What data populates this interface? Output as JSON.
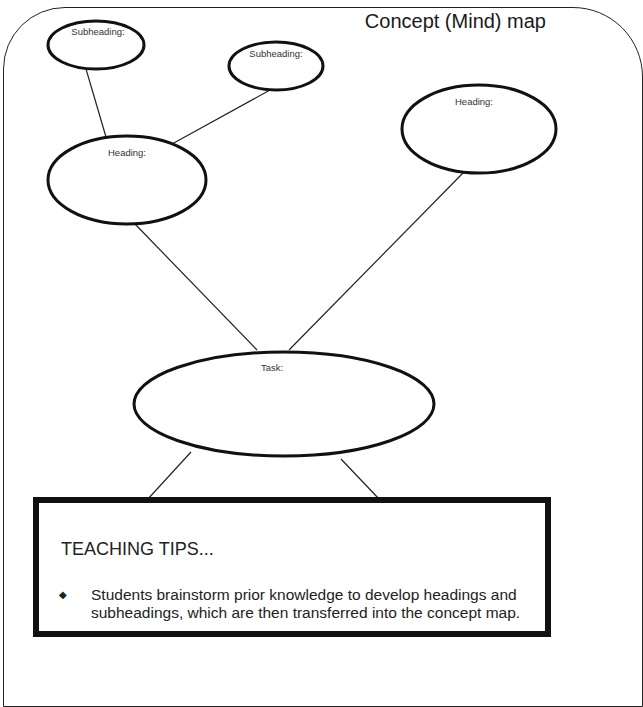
{
  "document": {
    "title": "Concept (Mind) map"
  },
  "nodes": {
    "subheading_1": {
      "label": "Subheading:"
    },
    "subheading_2": {
      "label": "Subheading:"
    },
    "heading_left": {
      "label": "Heading:"
    },
    "heading_right": {
      "label": "Heading:"
    },
    "task": {
      "label": "Task:"
    }
  },
  "tips": {
    "heading": "TEACHING TIPS...",
    "bullet_icon": "diamond-bullet",
    "items": [
      {
        "text": "Students brainstorm prior knowledge to develop headings and subheadings, which are then transferred into the concept map."
      }
    ]
  }
}
